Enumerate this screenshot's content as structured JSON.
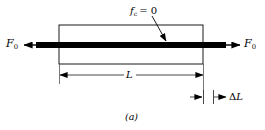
{
  "figure": {
    "caption": "(a)",
    "colors": {
      "ink": "#000000",
      "outline": "#1a1a1a",
      "bar": "#000000",
      "background": "#ffffff"
    }
  },
  "labels": {
    "force_left": {
      "symbol": "F",
      "subscript": "0"
    },
    "force_right": {
      "symbol": "F",
      "subscript": "0"
    },
    "constraint": {
      "symbol": "f",
      "subscript": "c",
      "relation": "= 0",
      "full": "f_c = 0"
    },
    "length": {
      "symbol": "L"
    },
    "elongation": {
      "delta": "Δ",
      "symbol": "L",
      "full": "ΔL"
    }
  },
  "geometry": {
    "body_left": 59,
    "body_right": 203,
    "body_top": 25,
    "body_bottom": 64,
    "bar_top": 42,
    "bar_bottom": 48,
    "bar_left": 36,
    "bar_right": 226,
    "dim_line_y": 75,
    "delta_line_y": 97,
    "delta_tick_left": 203,
    "delta_tick_right": 213
  }
}
